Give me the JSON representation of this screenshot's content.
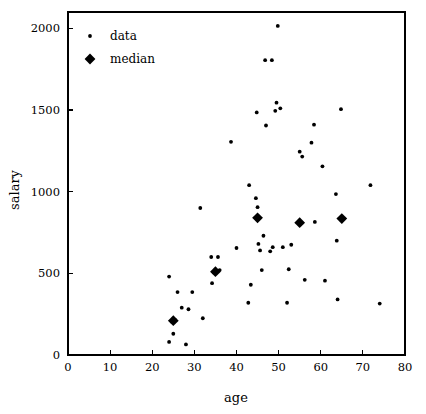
{
  "chart_data": {
    "type": "scatter",
    "title": "",
    "xlabel": "age",
    "ylabel": "salary",
    "xlim": [
      0,
      80
    ],
    "ylim": [
      0,
      2100
    ],
    "xticks": [
      0,
      10,
      20,
      30,
      40,
      50,
      60,
      70,
      80
    ],
    "yticks": [
      0,
      500,
      1000,
      1500,
      2000
    ],
    "grid": false,
    "legend_position": "upper-left",
    "legend": [
      {
        "name": "data",
        "marker": "dot"
      },
      {
        "name": "median",
        "marker": "diamond"
      }
    ],
    "series": [
      {
        "name": "data",
        "marker": "dot",
        "color": "#000000",
        "points": [
          [
            24,
            80
          ],
          [
            24,
            480
          ],
          [
            24.6,
            205
          ],
          [
            25,
            130
          ],
          [
            25.4,
            215
          ],
          [
            26,
            385
          ],
          [
            27,
            290
          ],
          [
            28,
            65
          ],
          [
            28.6,
            280
          ],
          [
            29.5,
            385
          ],
          [
            31.4,
            900
          ],
          [
            32,
            225
          ],
          [
            34,
            600
          ],
          [
            34.2,
            440
          ],
          [
            34.6,
            505
          ],
          [
            35,
            510
          ],
          [
            35.6,
            600
          ],
          [
            36,
            520
          ],
          [
            38.7,
            1305
          ],
          [
            40,
            655
          ],
          [
            42.8,
            320
          ],
          [
            43,
            1040
          ],
          [
            43.4,
            430
          ],
          [
            44.6,
            960
          ],
          [
            44.8,
            1485
          ],
          [
            45,
            905
          ],
          [
            45.2,
            680
          ],
          [
            45.6,
            640
          ],
          [
            46,
            520
          ],
          [
            46.4,
            730
          ],
          [
            47,
            1405
          ],
          [
            48,
            635
          ],
          [
            48.6,
            660
          ],
          [
            49.2,
            1495
          ],
          [
            49.5,
            1545
          ],
          [
            49.8,
            2015
          ],
          [
            50.4,
            1510
          ],
          [
            51,
            660
          ],
          [
            52,
            320
          ],
          [
            52.4,
            525
          ],
          [
            53,
            675
          ],
          [
            55,
            1245
          ],
          [
            55.6,
            1215
          ],
          [
            56.2,
            460
          ],
          [
            57.8,
            1300
          ],
          [
            58.4,
            1410
          ],
          [
            58.6,
            815
          ],
          [
            60.4,
            1155
          ],
          [
            61,
            455
          ],
          [
            63.6,
            985
          ],
          [
            63.8,
            700
          ],
          [
            64,
            340
          ],
          [
            64.8,
            1505
          ],
          [
            46.8,
            1805
          ],
          [
            48.4,
            1805
          ],
          [
            71.8,
            1040
          ],
          [
            74,
            315
          ]
        ]
      },
      {
        "name": "median",
        "marker": "diamond",
        "color": "#000000",
        "points": [
          [
            25,
            210
          ],
          [
            35,
            510
          ],
          [
            45,
            840
          ],
          [
            55,
            810
          ],
          [
            65,
            835
          ]
        ]
      }
    ]
  },
  "axes": {
    "x_title": "age",
    "y_title": "salary",
    "x_tick_labels": [
      "0",
      "10",
      "20",
      "30",
      "40",
      "50",
      "60",
      "70",
      "80"
    ],
    "y_tick_labels": [
      "0",
      "500",
      "1000",
      "1500",
      "2000"
    ]
  },
  "legend": {
    "data_label": "data",
    "median_label": "median"
  },
  "colors": {
    "marker": "#000000",
    "axis": "#000000",
    "background": "#ffffff"
  }
}
